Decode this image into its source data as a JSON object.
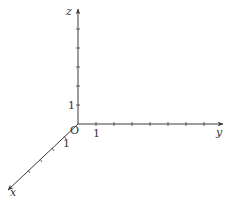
{
  "diagram": {
    "type": "3d-coordinate-axes",
    "origin_label": "O",
    "axes": [
      {
        "name": "x",
        "label": "x",
        "unit_label": "1",
        "direction": "down-left"
      },
      {
        "name": "y",
        "label": "y",
        "unit_label": "1",
        "direction": "right"
      },
      {
        "name": "z",
        "label": "z",
        "unit_label": "1",
        "direction": "up"
      }
    ],
    "colors": {
      "axis": "#3a3a3a",
      "text": "#333333",
      "background": "#ffffff"
    }
  }
}
